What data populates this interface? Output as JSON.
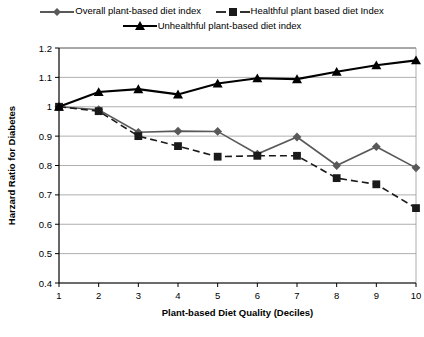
{
  "chart_data": {
    "type": "line",
    "title": "",
    "xlabel": "Plant-based Diet Quality (Deciles)",
    "ylabel": "Harzard Ratio for Diabetes",
    "categories": [
      "1",
      "2",
      "3",
      "4",
      "5",
      "6",
      "7",
      "8",
      "9",
      "10"
    ],
    "x": [
      1,
      2,
      3,
      4,
      5,
      6,
      7,
      8,
      9,
      10
    ],
    "xlim": [
      1,
      10
    ],
    "ylim": [
      0.4,
      1.2
    ],
    "yticks": [
      "1.2",
      "1.1",
      "1",
      "0.9",
      "0.8",
      "0.7",
      "0.6",
      "0.5",
      "0.4"
    ],
    "ytick_values": [
      1.2,
      1.1,
      1.0,
      0.9,
      0.8,
      0.7,
      0.6,
      0.5,
      0.4
    ],
    "grid": true,
    "legend_position": "top",
    "series": [
      {
        "name": "Overall plant-based diet index",
        "marker": "diamond",
        "line_style": "solid",
        "color": "#595959",
        "values": [
          1.0,
          0.99,
          0.913,
          0.917,
          0.916,
          0.839,
          0.897,
          0.8,
          0.864,
          0.792
        ]
      },
      {
        "name": "Healthful plant based diet Index",
        "marker": "square",
        "line_style": "dashed",
        "color": "#1a1a1a",
        "values": [
          1.0,
          0.985,
          0.9,
          0.866,
          0.83,
          0.833,
          0.833,
          0.757,
          0.736,
          0.655
        ]
      },
      {
        "name": "Unhealthful plant-based diet index",
        "marker": "triangle",
        "line_style": "solid",
        "color": "#000000",
        "values": [
          1.0,
          1.05,
          1.06,
          1.042,
          1.079,
          1.097,
          1.094,
          1.119,
          1.141,
          1.158
        ]
      }
    ]
  },
  "legend": {
    "row1": [
      {
        "label": "Overall plant-based diet index",
        "marker": "diamond-marker-icon",
        "color": "#595959",
        "dash": "none"
      },
      {
        "label": "Healthful plant based diet Index",
        "marker": "square-marker-icon",
        "color": "#1a1a1a",
        "dash": "dashed"
      }
    ],
    "row2": [
      {
        "label": "Unhealthful plant-based diet index",
        "marker": "triangle-marker-icon",
        "color": "#000000",
        "dash": "none"
      }
    ]
  }
}
